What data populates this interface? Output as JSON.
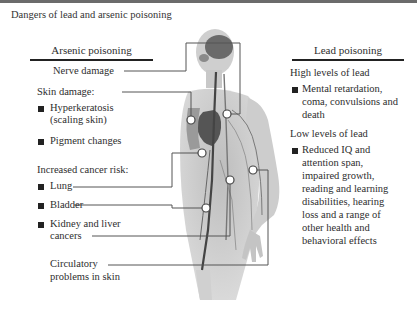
{
  "title": "Dangers of lead and arsenic poisoning",
  "arsenic": {
    "header": "Arsenic poisoning",
    "nerve": "Nerve damage",
    "skin": {
      "heading": "Skin damage:",
      "items": [
        "Hyperkeratosis",
        "(scaling skin)",
        "Pigment changes"
      ]
    },
    "cancer": {
      "heading": "Increased cancer risk:",
      "items": [
        "Lung",
        "Bladder",
        "Kidney and liver",
        "cancers"
      ]
    },
    "circulatory": [
      "Circulatory",
      "problems in skin"
    ]
  },
  "lead": {
    "header": "Lead poisoning",
    "high": {
      "heading": "High levels of lead",
      "lines": [
        "Mental retardation,",
        "coma, convulsions and",
        "death"
      ]
    },
    "low": {
      "heading": "Low levels of lead",
      "lines": [
        "Reduced IQ and",
        "attention span,",
        "impaired growth,",
        "reading and learning",
        "disabilities, hearing",
        "loss and a range of",
        "other health and",
        "behavioral effects"
      ]
    }
  },
  "colors": {
    "text": "#2e2e2e",
    "leader_line": "#555555",
    "body_fill": "#c9c9c9",
    "topbar": "#6b6b6b"
  }
}
